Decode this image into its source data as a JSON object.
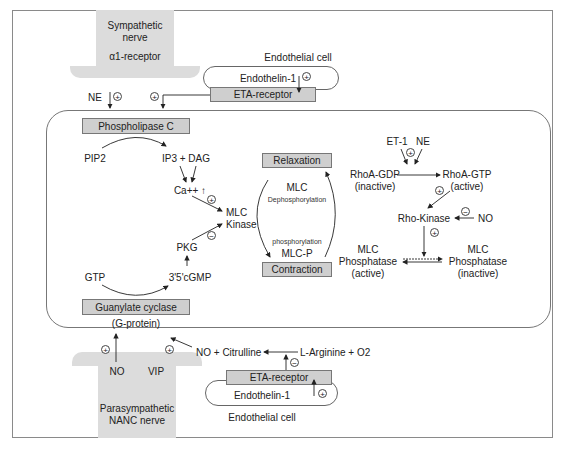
{
  "diagram": {
    "top": {
      "sympathetic_nerve": {
        "line1": "Sympathetic",
        "line2": "nerve",
        "receptor": "α1-receptor"
      },
      "endothelial_cell_label": "Endothelial cell",
      "endothelin": "Endothelin-1",
      "et_receptor": "ETA-receptor",
      "ne_label": "NE"
    },
    "left_pathway": {
      "phospholipase": "Phospholipase C",
      "pip2": "PIP2",
      "ip3_dag": "IP3 + DAG",
      "ca": "Ca++ ↑",
      "mlc_kinase_1": "MLC",
      "mlc_kinase_2": "Kinase",
      "pkg": "PKG",
      "cgmp": "3'5'cGMP",
      "gtp": "GTP",
      "guanylate": "Guanylate cyclase",
      "gprotein": "(G-protein)"
    },
    "center": {
      "relaxation": "Relaxation",
      "contraction": "Contraction",
      "mlc": "MLC",
      "dephos": "Dephosphorylation",
      "phos": "phosphorylation",
      "mlcp": "MLC-P"
    },
    "right_pathway": {
      "et1": "ET-1",
      "ne": "NE",
      "rhoa_gdp": "RhoA-GDP",
      "rhoa_gdp_state": "(inactive)",
      "rhoa_gtp": "RhoA-GTP",
      "rhoa_gtp_state": "(active)",
      "rho_kinase": "Rho-Kinase",
      "no": "NO",
      "mlcp_active_1": "MLC",
      "mlcp_active_2": "Phosphatase",
      "mlcp_active_3": "(active)",
      "mlcp_inactive_1": "MLC",
      "mlcp_inactive_2": "Phosphatase",
      "mlcp_inactive_3": "(inactive)"
    },
    "bottom": {
      "no": "NO",
      "vip": "VIP",
      "parasympathetic_1": "Parasympathetic",
      "parasympathetic_2": "NANC nerve",
      "no_citrulline": "NO + Citrulline",
      "larginine": "L-Arginine + O2",
      "et_receptor": "ETA-receptor",
      "endothelin": "Endothelin-1",
      "endothelial_cell_label": "Endothelial cell"
    },
    "signs": {
      "plus": "+",
      "minus": "−"
    }
  }
}
